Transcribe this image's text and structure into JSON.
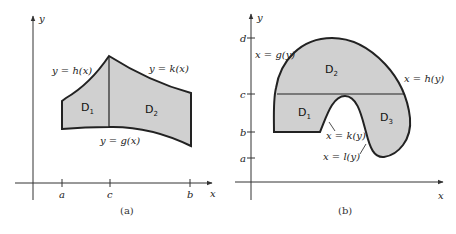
{
  "figure_a": {
    "caption": "(a)",
    "axes": {
      "x_label": "x",
      "y_label": "y"
    },
    "ticks": {
      "a": "a",
      "c": "c",
      "b": "b"
    },
    "curves": {
      "top_left": "y = h(x)",
      "top_right": "y = k(x)",
      "bottom": "y = g(x)"
    },
    "regions": [
      {
        "main": "D",
        "sub": "1"
      },
      {
        "main": "D",
        "sub": "2"
      }
    ],
    "colors": {
      "fill": "#d0d0d0",
      "stroke": "#222222"
    }
  },
  "figure_b": {
    "caption": "(b)",
    "axes": {
      "x_label": "x",
      "y_label": "y"
    },
    "ticks": {
      "d": "d",
      "c": "c",
      "b": "b",
      "a": "a"
    },
    "curves": {
      "left": "x = g(y)",
      "right": "x = h(y)",
      "inner_left": "x = k(y)",
      "inner_right": "x = l(y)"
    },
    "regions": [
      {
        "main": "D",
        "sub": "1"
      },
      {
        "main": "D",
        "sub": "2"
      },
      {
        "main": "D",
        "sub": "3"
      }
    ],
    "colors": {
      "fill": "#d0d0d0",
      "stroke": "#222222"
    }
  }
}
